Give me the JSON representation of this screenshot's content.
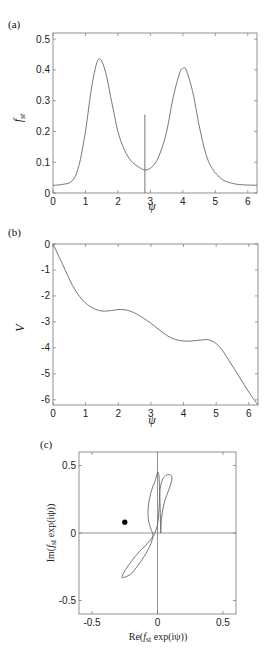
{
  "chart_data": [
    {
      "panel_label": "(a)",
      "type": "line",
      "xlabel": "ψ",
      "ylabel": "f_st",
      "xlim": [
        0,
        6.283
      ],
      "ylim": [
        0,
        0.52
      ],
      "xticks": [
        0,
        1,
        2,
        3,
        4,
        5,
        6
      ],
      "yticks": [
        0,
        0.1,
        0.2,
        0.3,
        0.4,
        0.5
      ],
      "grid": false,
      "series": [
        {
          "name": "f_st",
          "x": [
            0,
            0.3,
            0.6,
            0.8,
            1.0,
            1.2,
            1.4,
            1.6,
            1.8,
            2.0,
            2.2,
            2.4,
            2.6,
            2.85,
            3.1,
            3.3,
            3.5,
            3.7,
            3.9,
            4.0,
            4.1,
            4.3,
            4.5,
            4.7,
            4.9,
            5.2,
            5.5,
            5.8,
            6.283
          ],
          "y": [
            0.025,
            0.028,
            0.04,
            0.09,
            0.2,
            0.35,
            0.435,
            0.4,
            0.3,
            0.2,
            0.14,
            0.105,
            0.087,
            0.075,
            0.09,
            0.13,
            0.2,
            0.31,
            0.39,
            0.405,
            0.4,
            0.33,
            0.22,
            0.13,
            0.08,
            0.045,
            0.032,
            0.027,
            0.025
          ]
        }
      ],
      "annotations": [
        {
          "type": "vertical-line",
          "x": 2.83,
          "y_from": 0,
          "y_to": 0.255
        }
      ]
    },
    {
      "panel_label": "(b)",
      "type": "line",
      "xlabel": "ψ",
      "ylabel": "V",
      "xlim": [
        0,
        6.283
      ],
      "ylim": [
        -6.2,
        0
      ],
      "xticks": [
        0,
        1,
        2,
        3,
        4,
        5,
        6
      ],
      "yticks": [
        0,
        -1,
        -2,
        -3,
        -4,
        -5,
        -6
      ],
      "grid": false,
      "series": [
        {
          "name": "V",
          "x": [
            0,
            0.3,
            0.6,
            0.9,
            1.2,
            1.5,
            1.8,
            2.1,
            2.4,
            2.7,
            3.0,
            3.3,
            3.6,
            3.9,
            4.2,
            4.5,
            4.8,
            5.1,
            5.4,
            5.7,
            6.0,
            6.283
          ],
          "y": [
            0,
            -0.8,
            -1.6,
            -2.15,
            -2.45,
            -2.58,
            -2.56,
            -2.52,
            -2.6,
            -2.8,
            -3.05,
            -3.35,
            -3.6,
            -3.72,
            -3.74,
            -3.7,
            -3.7,
            -3.95,
            -4.5,
            -5.1,
            -5.7,
            -6.2
          ]
        }
      ]
    },
    {
      "panel_label": "(c)",
      "type": "line",
      "xlabel": "Re(f_st exp(iψ))",
      "ylabel": "Im(f_st exp(iψ))",
      "xlim": [
        -0.6,
        0.6
      ],
      "ylim": [
        -0.6,
        0.6
      ],
      "xticks": [
        -0.5,
        0,
        0.5
      ],
      "yticks": [
        -0.5,
        0,
        0.5
      ],
      "grid": false,
      "axes_lines": {
        "x0": true,
        "y0": true
      },
      "series": [
        {
          "name": "closed curve",
          "x": [
            0.025,
            0.03,
            0.05,
            0.09,
            0.11,
            0.1,
            0.07,
            0.04,
            0.02,
            0.015,
            0.01,
            0.0,
            -0.03,
            -0.08,
            -0.15,
            -0.23,
            -0.27,
            -0.26,
            -0.2,
            -0.12,
            -0.06,
            -0.035,
            -0.05,
            -0.07,
            -0.07,
            -0.05,
            -0.02,
            0.01,
            0.025
          ],
          "y": [
            0.0,
            0.1,
            0.22,
            0.33,
            0.4,
            0.43,
            0.43,
            0.4,
            0.33,
            0.25,
            0.15,
            0.06,
            -0.02,
            -0.08,
            -0.15,
            -0.25,
            -0.32,
            -0.33,
            -0.3,
            -0.2,
            -0.1,
            -0.02,
            0.03,
            0.1,
            0.2,
            0.3,
            0.38,
            0.43,
            0.0
          ]
        }
      ],
      "points": [
        {
          "x": -0.25,
          "y": 0.08,
          "marker": "filled-circle"
        }
      ]
    }
  ],
  "labels": {
    "panel_a": "(a)",
    "panel_b": "(b)",
    "panel_c": "(c)",
    "a_xlabel": "ψ",
    "a_ylabel_main": "f",
    "a_ylabel_sub": "st",
    "b_xlabel": "ψ",
    "b_ylabel": "V",
    "c_xlabel_pre": "Re(",
    "c_xlabel_f": "f",
    "c_xlabel_sub": "st",
    "c_xlabel_post": " exp(iψ))",
    "c_ylabel_pre": "Im(",
    "c_ylabel_f": "f",
    "c_ylabel_sub": "st",
    "c_ylabel_post": " exp(iψ))"
  }
}
